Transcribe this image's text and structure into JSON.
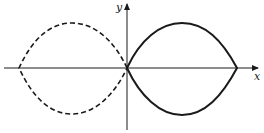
{
  "figure": {
    "axes": {
      "x_label": "x",
      "y_label": "y",
      "origin": [
        127,
        68
      ]
    },
    "curves": [
      {
        "name": "right-loop",
        "style": "solid",
        "x_range": [
          127,
          237
        ],
        "top_y": 23,
        "bottom_y": 115
      },
      {
        "name": "left-loop",
        "style": "dashed",
        "x_range": [
          19,
          127
        ],
        "top_y": 23,
        "bottom_y": 114
      }
    ],
    "colors": {
      "stroke": "#1a1a1a",
      "background": "#ffffff"
    }
  }
}
